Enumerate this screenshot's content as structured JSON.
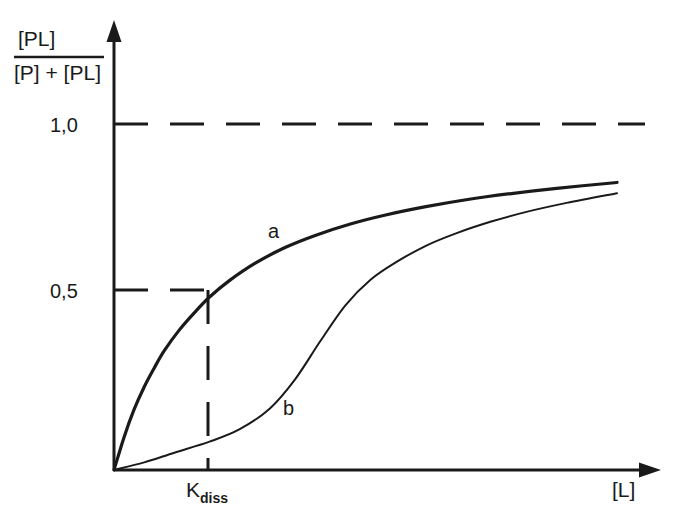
{
  "chart_data": {
    "type": "line",
    "title": "",
    "subtitle": "",
    "xlabel": "[L]",
    "ylabel_numerator": "[PL]",
    "ylabel_denominator": "[P] + [PL]",
    "grid": false,
    "legend_position": "inline-curve-labels",
    "xlim": [
      0,
      1.0
    ],
    "ylim": [
      0,
      1.15
    ],
    "y_ticks": [
      {
        "value": 1.0,
        "label": "1,0"
      },
      {
        "value": 0.5,
        "label": "0,5"
      }
    ],
    "x_ticks": [
      {
        "value": 0.19,
        "label_main": "K",
        "label_sub": "diss"
      }
    ],
    "annotations": [
      {
        "name": "asymptote-line",
        "type": "horizontal-dashed",
        "y": 1.0
      },
      {
        "name": "half-saturation-line",
        "type": "horizontal-dashed",
        "y": 0.5
      },
      {
        "name": "kdiss-dropline",
        "type": "vertical-dashed",
        "x": 0.19
      }
    ],
    "series": [
      {
        "name": "a",
        "label": "a",
        "description": "hyperbolic non-cooperative binding",
        "line_width": 3.2,
        "x": [
          0.0,
          0.02,
          0.04,
          0.06,
          0.08,
          0.1,
          0.13,
          0.16,
          0.19,
          0.23,
          0.28,
          0.34,
          0.4,
          0.47,
          0.54,
          0.62,
          0.7,
          0.79,
          0.88,
          1.0
        ],
        "y": [
          0.0,
          0.095,
          0.175,
          0.24,
          0.295,
          0.345,
          0.405,
          0.455,
          0.5,
          0.548,
          0.597,
          0.643,
          0.678,
          0.711,
          0.737,
          0.761,
          0.781,
          0.799,
          0.814,
          0.831
        ]
      },
      {
        "name": "b",
        "label": "b",
        "description": "sigmoidal cooperative binding",
        "line_width": 2.0,
        "x": [
          0.0,
          0.06,
          0.12,
          0.19,
          0.25,
          0.31,
          0.36,
          0.41,
          0.46,
          0.51,
          0.56,
          0.62,
          0.68,
          0.75,
          0.82,
          0.9,
          1.0
        ],
        "y": [
          0.0,
          0.022,
          0.05,
          0.082,
          0.118,
          0.178,
          0.262,
          0.372,
          0.476,
          0.55,
          0.6,
          0.648,
          0.684,
          0.718,
          0.746,
          0.772,
          0.8
        ]
      }
    ],
    "curve_labels": [
      {
        "series": "a",
        "text": "a",
        "x": 0.3,
        "y": 0.645
      },
      {
        "series": "b",
        "text": "b",
        "x": 0.375,
        "y": 0.16
      }
    ],
    "colors": {
      "ink": "#1a1a1a",
      "background": "#ffffff"
    }
  }
}
